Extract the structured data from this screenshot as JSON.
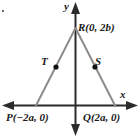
{
  "figure": {
    "axes": {
      "x_label": "x",
      "y_label": "y",
      "x_axis_name": "x-axis",
      "y_axis_name": "y-axis",
      "axis_color": "#2b2b2b"
    },
    "triangle": {
      "stroke_color": "#8c8c8c",
      "vertices": [
        {
          "name": "R",
          "label": "R(0, 2b)",
          "coords_text": "(0, 2b)"
        },
        {
          "name": "P",
          "label": "P(−2a, 0)",
          "coords_text": "(−2a, 0)"
        },
        {
          "name": "Q",
          "label": "Q(2a, 0)",
          "coords_text": "(2a, 0)"
        }
      ],
      "midpoints": [
        {
          "name": "T",
          "label": "T",
          "on_segment": "PR",
          "dot_color": "#111111"
        },
        {
          "name": "S",
          "label": "S",
          "on_segment": "QR",
          "dot_color": "#111111"
        }
      ]
    }
  }
}
